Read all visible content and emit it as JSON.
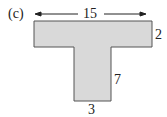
{
  "figure": {
    "label": "(c)",
    "shape": "T-shape",
    "fill_color": "#d9d9d9",
    "stroke_color": "#555555",
    "dimensions": {
      "top_width": "15",
      "top_height": "2",
      "stem_height": "7",
      "stem_width": "3"
    }
  }
}
